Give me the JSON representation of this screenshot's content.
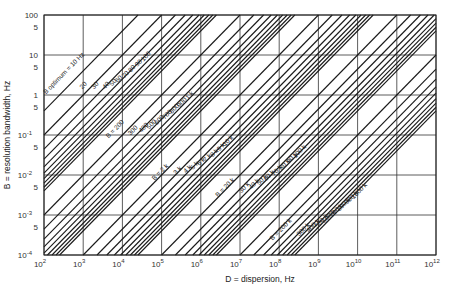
{
  "chart_data": {
    "type": "line",
    "title": "",
    "xlabel": "D = dispersion, Hz",
    "ylabel": "B = resolution bandwidth, Hz",
    "xscale": "log",
    "yscale": "log",
    "xlim": [
      100,
      1000000000000
    ],
    "ylim": [
      0.0001,
      100
    ],
    "grid": true,
    "x_ticks": [
      {
        "base": "10",
        "exp": "2"
      },
      {
        "base": "10",
        "exp": "3"
      },
      {
        "base": "10",
        "exp": "4"
      },
      {
        "base": "10",
        "exp": "5"
      },
      {
        "base": "10",
        "exp": "6"
      },
      {
        "base": "10",
        "exp": "7"
      },
      {
        "base": "10",
        "exp": "8"
      },
      {
        "base": "10",
        "exp": "9"
      },
      {
        "base": "10",
        "exp": "10"
      },
      {
        "base": "10",
        "exp": "11"
      },
      {
        "base": "10",
        "exp": "12"
      }
    ],
    "y_ticks": [
      {
        "value": 100,
        "label": "100",
        "exp": ""
      },
      {
        "value": 50,
        "label": "5",
        "exp": ""
      },
      {
        "value": 10,
        "label": "10",
        "exp": ""
      },
      {
        "value": 5,
        "label": "5",
        "exp": ""
      },
      {
        "value": 1,
        "label": "1",
        "exp": ""
      },
      {
        "value": 0.5,
        "label": "5",
        "exp": ""
      },
      {
        "value": 0.1,
        "label": "10",
        "exp": "-1"
      },
      {
        "value": 0.05,
        "label": "5",
        "exp": ""
      },
      {
        "value": 0.01,
        "label": "10",
        "exp": "-2"
      },
      {
        "value": 0.005,
        "label": "5",
        "exp": ""
      },
      {
        "value": 0.001,
        "label": "10",
        "exp": "-3"
      },
      {
        "value": 0.0005,
        "label": "5",
        "exp": ""
      },
      {
        "value": 0.0001,
        "label": "10",
        "exp": "-4"
      }
    ],
    "relation": "B proportional to D / B_optimum^2 (constant-slope diagonal lines)",
    "line_constant_factor": 2.5,
    "series": [
      {
        "name": "B_optimum = 10 Hz",
        "b_opt": 10,
        "label": "B optimum = 10 Hz",
        "label_at": [
          350,
          3.2
        ]
      },
      {
        "name": "20",
        "b_opt": 20,
        "label": "20",
        "label_at": [
          1100,
          1.6
        ]
      },
      {
        "name": "30",
        "b_opt": 30,
        "label": "30",
        "label_at": [
          2200,
          1.6
        ]
      },
      {
        "name": "40",
        "b_opt": 40,
        "label": "40",
        "label_at": [
          4200,
          1.6
        ]
      },
      {
        "name": "50",
        "b_opt": 50,
        "label": "50",
        "label_at": [
          6300,
          1.9
        ]
      },
      {
        "name": "60",
        "b_opt": 60,
        "label": "60",
        "label_at": [
          8800,
          2.3
        ]
      },
      {
        "name": "70",
        "b_opt": 70,
        "label": "70",
        "label_at": [
          13000,
          3.0
        ]
      },
      {
        "name": "80",
        "b_opt": 80,
        "label": "80",
        "label_at": [
          19000,
          4.2
        ]
      },
      {
        "name": "90",
        "b_opt": 90,
        "label": "90",
        "label_at": [
          28000,
          5.8
        ]
      },
      {
        "name": "100",
        "b_opt": 100,
        "label": "100",
        "label_at": [
          43000,
          8.5
        ]
      },
      {
        "name": "B = 200",
        "b_opt": 200,
        "label": "B = 200",
        "label_at": [
          7000,
          0.13
        ]
      },
      {
        "name": "300",
        "b_opt": 300,
        "label": "300",
        "label_at": [
          20000,
          0.12
        ]
      },
      {
        "name": "400",
        "b_opt": 400,
        "label": "400",
        "label_at": [
          38000,
          0.14
        ]
      },
      {
        "name": "500",
        "b_opt": 500,
        "label": "500",
        "label_at": [
          60000,
          0.17
        ]
      },
      {
        "name": "600",
        "b_opt": 600,
        "label": "600",
        "label_at": [
          95000,
          0.22
        ]
      },
      {
        "name": "700",
        "b_opt": 700,
        "label": "700",
        "label_at": [
          150000,
          0.3
        ]
      },
      {
        "name": "800",
        "b_opt": 800,
        "label": "800",
        "label_at": [
          230000,
          0.42
        ]
      },
      {
        "name": "900",
        "b_opt": 900,
        "label": "900",
        "label_at": [
          360000,
          0.6
        ]
      },
      {
        "name": "1 k",
        "b_opt": 1000,
        "label": "1 k",
        "label_at": [
          560000,
          0.9
        ]
      },
      {
        "name": "B = 2 k",
        "b_opt": 2000,
        "label": "B = 2 k",
        "label_at": [
          100000,
          0.011
        ]
      },
      {
        "name": "3 k",
        "b_opt": 3000,
        "label": "3 k",
        "label_at": [
          280000,
          0.012
        ]
      },
      {
        "name": "4 k",
        "b_opt": 4000,
        "label": "4 k",
        "label_at": [
          500000,
          0.013
        ]
      },
      {
        "name": "5 k",
        "b_opt": 5000,
        "label": "5 k",
        "label_at": [
          760000,
          0.016
        ]
      },
      {
        "name": "6 k",
        "b_opt": 6000,
        "label": "6 k",
        "label_at": [
          1100000,
          0.02
        ]
      },
      {
        "name": "7 k",
        "b_opt": 7000,
        "label": "7 k",
        "label_at": [
          1600000,
          0.025
        ]
      },
      {
        "name": "8 k",
        "b_opt": 8000,
        "label": "8 k",
        "label_at": [
          2400000,
          0.033
        ]
      },
      {
        "name": "9 k",
        "b_opt": 9000,
        "label": "9 k",
        "label_at": [
          3600000,
          0.046
        ]
      },
      {
        "name": "10 k",
        "b_opt": 10000,
        "label": "10 k",
        "label_at": [
          5400000,
          0.066
        ]
      },
      {
        "name": "B = 20 k",
        "b_opt": 20000,
        "label": "B = 20 k",
        "label_at": [
          4500000,
          0.0045
        ]
      },
      {
        "name": "30 k",
        "b_opt": 30000,
        "label": "30 k",
        "label_at": [
          14000000,
          0.0045
        ]
      },
      {
        "name": "40 k",
        "b_opt": 40000,
        "label": "40 k",
        "label_at": [
          25000000,
          0.0055
        ]
      },
      {
        "name": "50 k",
        "b_opt": 50000,
        "label": "50 k",
        "label_at": [
          40000000,
          0.007
        ]
      },
      {
        "name": "60 k",
        "b_opt": 60000,
        "label": "60 k",
        "label_at": [
          60000000,
          0.009
        ]
      },
      {
        "name": "70 k",
        "b_opt": 70000,
        "label": "70 k",
        "label_at": [
          95000000,
          0.012
        ]
      },
      {
        "name": "80 k",
        "b_opt": 80000,
        "label": "80 k",
        "label_at": [
          150000000,
          0.017
        ]
      },
      {
        "name": "90 k",
        "b_opt": 90000,
        "label": "90 k",
        "label_at": [
          230000000,
          0.025
        ]
      },
      {
        "name": "100 k",
        "b_opt": 100000,
        "label": "100 k",
        "label_at": [
          360000000,
          0.036
        ]
      },
      {
        "name": "B = 200 k",
        "b_opt": 200000,
        "label": "B = 200 k",
        "label_at": [
          120000000,
          0.0004
        ]
      },
      {
        "name": "300 k",
        "b_opt": 300000,
        "label": "300 k",
        "label_at": [
          450000000,
          0.0004
        ]
      },
      {
        "name": "400 k",
        "b_opt": 400000,
        "label": "400 k",
        "label_at": [
          800000000,
          0.0005
        ]
      },
      {
        "name": "500 k",
        "b_opt": 500000,
        "label": "500 k",
        "label_at": [
          1300000000,
          0.00065
        ]
      },
      {
        "name": "600 k",
        "b_opt": 600000,
        "label": "600 k",
        "label_at": [
          2000000000,
          0.00085
        ]
      },
      {
        "name": "700 k",
        "b_opt": 700000,
        "label": "700 k",
        "label_at": [
          3100000000,
          0.0012
        ]
      },
      {
        "name": "800 k",
        "b_opt": 800000,
        "label": "800 k",
        "label_at": [
          4800000000,
          0.0017
        ]
      },
      {
        "name": "900 k",
        "b_opt": 900000,
        "label": "900 k",
        "label_at": [
          7500000000,
          0.0025
        ]
      },
      {
        "name": "1000 k",
        "b_opt": 1000000,
        "label": "1000 k",
        "label_at": [
          12000000000,
          0.0037
        ]
      }
    ]
  },
  "colors": {
    "background": "#ffffff",
    "line": "#1a1a1a",
    "grid": "#333333",
    "text": "#222222"
  }
}
